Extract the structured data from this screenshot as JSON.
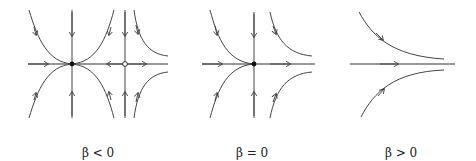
{
  "panels": [
    {
      "id": "beta-negative",
      "caption": "β < 0",
      "caption_x": 82,
      "fixed_points": [
        {
          "type": "stable-filled",
          "x": 72,
          "y": 64
        },
        {
          "type": "unstable-open",
          "x": 125,
          "y": 64
        }
      ]
    },
    {
      "id": "beta-zero",
      "caption": "β = 0",
      "caption_x": 236,
      "fixed_points": [
        {
          "type": "semistable-filled",
          "x": 254,
          "y": 64
        }
      ]
    },
    {
      "id": "beta-positive",
      "caption": "β > 0",
      "caption_x": 385,
      "fixed_points": []
    }
  ],
  "colors": {
    "stroke": "#444444",
    "background": "#ffffff"
  }
}
